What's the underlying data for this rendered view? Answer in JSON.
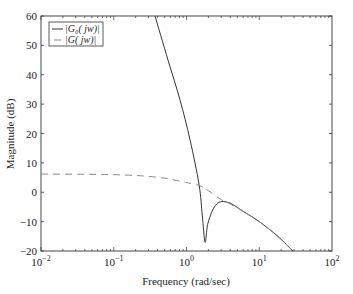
{
  "chart_data": {
    "type": "line",
    "title": "",
    "xlabel": "Frequency (rad/sec)",
    "ylabel": "Magnitude (dB)",
    "xscale": "log",
    "xlim": [
      0.01,
      100
    ],
    "ylim": [
      -20,
      60
    ],
    "grid": false,
    "legend_position": "upper left",
    "x_tick_labels": [
      "10^-2",
      "10^-1",
      "10^0",
      "10^1",
      "10^2"
    ],
    "x_ticks": [
      0.01,
      0.1,
      1,
      10,
      100
    ],
    "y_ticks": [
      -20,
      -10,
      0,
      10,
      20,
      30,
      40,
      50,
      60
    ],
    "y_tick_labels": [
      "−20",
      "−10",
      "0",
      "10",
      "20",
      "30",
      "40",
      "50",
      "60"
    ],
    "series": [
      {
        "name": "|G0(jw)|",
        "style": "solid",
        "color": "#333333",
        "x": [
          0.369,
          0.557,
          0.815,
          1.12,
          1.49,
          1.65,
          1.8,
          1.95,
          2.25,
          2.6,
          3.0,
          3.5,
          4.2,
          6.0,
          10,
          18,
          29
        ],
        "y": [
          60,
          45,
          31.4,
          17.8,
          2.5,
          -8,
          -17,
          -11,
          -6.5,
          -4,
          -3.2,
          -3.3,
          -4,
          -6.5,
          -10,
          -15,
          -20
        ]
      },
      {
        "name": "|G(jw)|",
        "style": "dashed",
        "color": "#888888",
        "x": [
          0.01,
          0.05,
          0.1,
          0.2,
          0.3,
          0.5,
          0.8,
          1.0,
          1.5,
          2.0,
          3.0,
          4.0,
          6.0,
          10,
          18,
          29
        ],
        "y": [
          6.2,
          6.1,
          6.0,
          5.7,
          5.4,
          4.8,
          3.8,
          3.3,
          2.3,
          0.5,
          -2.5,
          -4,
          -6.5,
          -10,
          -15,
          -20
        ]
      }
    ]
  },
  "legend": {
    "items": [
      {
        "label": "|G₀( jw)|",
        "style": "solid"
      },
      {
        "label": "|G( jw)|",
        "style": "dashed"
      }
    ]
  },
  "axes": {
    "xlabel": "Frequency (rad/sec)",
    "ylabel": "Magnitude (dB)"
  }
}
